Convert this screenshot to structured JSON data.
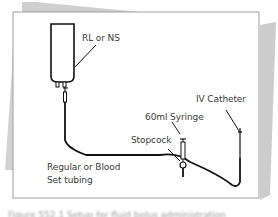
{
  "diagram": {
    "type": "medical-setup-illustration",
    "labels": {
      "bag": "RL or NS",
      "catheter": "IV Catheter",
      "syringe": "60ml Syringe",
      "stopcock": "Stopcock",
      "tubing_line1": "Regular or Blood",
      "tubing_line2": "Set tubing"
    },
    "caption": "Figure 552.1 Setup for fluid bolus administration",
    "colors": {
      "line": "#111111",
      "page_border": "#9a9a9a",
      "shadow": "#c8c8c8",
      "text": "#3a3a3a"
    }
  }
}
